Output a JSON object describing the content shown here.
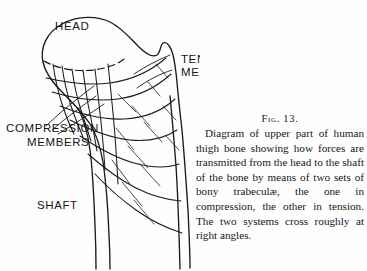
{
  "figure": {
    "number_label": "Fig. 13.",
    "caption": "Diagram of upper part of human thigh bone showing how forces are transmitted from the head to the shaft of the bone by means of two sets of bony trabeculæ, the one in compression, the other in tension. The two systems cross roughly at right angles.",
    "labels": {
      "head": "HEAD",
      "tension_line1": "TENSION",
      "tension_line2": "MEMBERS",
      "compression_line1": "COMPRESSION",
      "compression_line2": "MEMBERS",
      "shaft": "SHAFT"
    },
    "colors": {
      "ink": "#1a1a1a",
      "paper": "#fefefe"
    },
    "icons": {
      "bone_outline": "femur-outline-icon",
      "trabeculae": "trabeculae-lines-icon",
      "epiphyseal_line": "dashed-epiphyseal-line-icon"
    }
  }
}
